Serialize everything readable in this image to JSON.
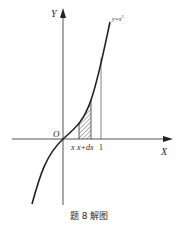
{
  "figure": {
    "caption": "题 8 解图",
    "axes": {
      "x_label": "X",
      "y_label": "Y",
      "origin_label": "O"
    },
    "curve": {
      "label": "y=x",
      "exponent": "3",
      "function": "y = x^3"
    },
    "tick_labels": {
      "x": "x",
      "x_plus_dx": "x+dx",
      "one": "1"
    },
    "shaded_region": {
      "description": "hatched strip between x and x+dx under the curve",
      "from": "x",
      "to": "x+dx"
    },
    "colors": {
      "line": "#2a2a2a",
      "axis": "#555555",
      "background": "#ffffff"
    }
  }
}
